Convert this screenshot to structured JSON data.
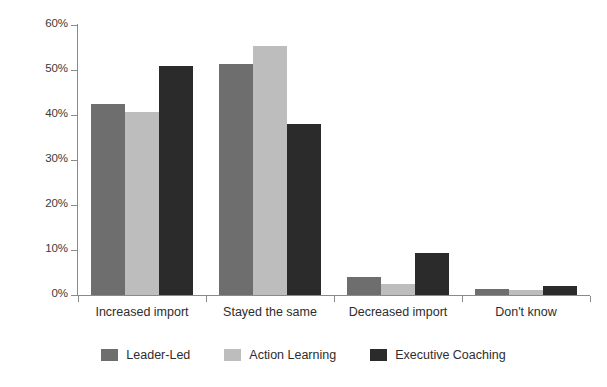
{
  "chart_data": {
    "type": "bar",
    "title": "",
    "subtitle": "",
    "xlabel": "",
    "ylabel": "",
    "ylim": [
      0,
      60
    ],
    "ytick_values": [
      0,
      10,
      20,
      30,
      40,
      50,
      60
    ],
    "ytick_labels": [
      "0%",
      "10%",
      "20%",
      "30%",
      "40%",
      "50%",
      "60%"
    ],
    "grid": false,
    "legend_position": "bottom",
    "categories": [
      "Increased import",
      "Stayed the same",
      "Decreased import",
      "Don't know"
    ],
    "series": [
      {
        "name": "Leader-Led",
        "color": "#6e6e6e",
        "values": [
          42.5,
          51.3,
          4.0,
          1.3
        ]
      },
      {
        "name": "Action Learning",
        "color": "#bdbdbd",
        "values": [
          40.7,
          55.4,
          2.4,
          1.2
        ]
      },
      {
        "name": "Executive Coaching",
        "color": "#2b2b2b",
        "values": [
          50.9,
          38.0,
          9.3,
          2.0
        ]
      }
    ],
    "axis_color": "#8a8a8a",
    "text_color": "#2d2d2d",
    "background_color": "#ffffff"
  }
}
